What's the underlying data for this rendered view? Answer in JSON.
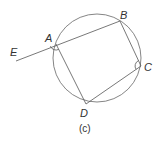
{
  "figure": {
    "caption": "(c)",
    "circle": {
      "cx": 97,
      "cy": 58,
      "r": 44
    },
    "points": {
      "A": {
        "label": "A",
        "x": 56,
        "y": 44
      },
      "B": {
        "label": "B",
        "x": 120,
        "y": 21
      },
      "C": {
        "label": "C",
        "x": 141,
        "y": 66
      },
      "D": {
        "label": "D",
        "x": 86,
        "y": 104
      },
      "E": {
        "label": "E",
        "x": 16,
        "y": 61
      }
    },
    "segments": [
      "EB",
      "BC",
      "CD",
      "DA"
    ],
    "angle_marks": [
      {
        "vertex": "A",
        "between": [
          "E",
          "D"
        ]
      },
      {
        "vertex": "C",
        "between": [
          "B",
          "D"
        ]
      }
    ],
    "stroke_color": "#555555",
    "label_color": "#333333"
  }
}
